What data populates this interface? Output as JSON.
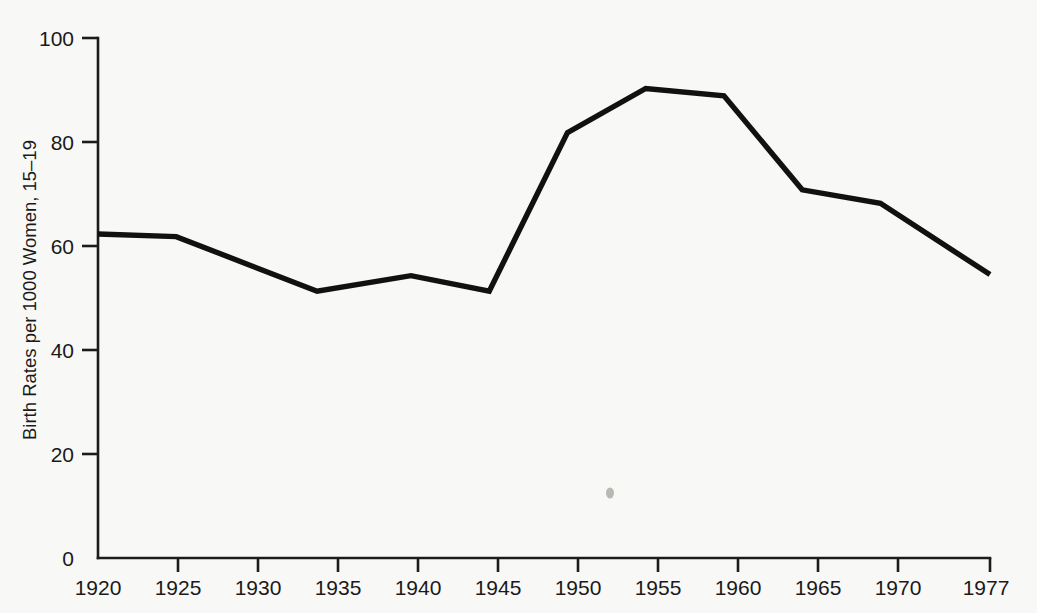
{
  "chart_data": {
    "type": "line",
    "title": "",
    "subtitle": "",
    "xlabel": "",
    "ylabel": "Birth Rates per 1000 Women, 15–19",
    "x": [
      1920,
      1925,
      1934,
      1940,
      1945,
      1950,
      1955,
      1960,
      1965,
      1970,
      1977
    ],
    "values": [
      62.3,
      61.8,
      51.3,
      54.3,
      51.3,
      81.8,
      90.3,
      88.9,
      70.8,
      68.2,
      54.5
    ],
    "series": [
      {
        "name": "Birth Rates per 1000 Women, 15-19",
        "x": [
          1920,
          1925,
          1934,
          1940,
          1945,
          1950,
          1955,
          1960,
          1965,
          1970,
          1977
        ],
        "values": [
          62.3,
          61.8,
          51.3,
          54.3,
          51.3,
          81.8,
          90.3,
          88.9,
          70.8,
          68.2,
          54.5
        ]
      }
    ],
    "xlim": [
      1920,
      1977
    ],
    "ylim": [
      0,
      100
    ],
    "xticks": [
      1920,
      1925,
      1930,
      1935,
      1940,
      1945,
      1950,
      1955,
      1960,
      1965,
      1970,
      1977
    ],
    "xtick_labels": [
      "1920",
      "1925",
      "1930",
      "1935",
      "1940",
      "1945",
      "1950",
      "1955",
      "1960",
      "1965",
      "1970",
      "1977"
    ],
    "yticks": [
      0,
      20,
      40,
      60,
      80,
      100
    ],
    "ytick_labels": [
      "0",
      "20",
      "40",
      "60",
      "80",
      "100"
    ],
    "grid": false,
    "legend": false,
    "legend_position": "none",
    "line_color": "#111111",
    "background_color": "#f8f8f6",
    "axis_color": "#1c1c1c",
    "annotations": []
  },
  "axes": {
    "y_title": "Birth Rates per 1000 Women, 15–19",
    "x_tick_0": "1920",
    "x_tick_1": "1925",
    "x_tick_2": "1930",
    "x_tick_3": "1935",
    "x_tick_4": "1940",
    "x_tick_5": "1945",
    "x_tick_6": "1950",
    "x_tick_7": "1955",
    "x_tick_8": "1960",
    "x_tick_9": "1965",
    "x_tick_10": "1970",
    "x_tick_11": "1977",
    "y_tick_0": "0",
    "y_tick_1": "20",
    "y_tick_2": "40",
    "y_tick_3": "60",
    "y_tick_4": "80",
    "y_tick_5": "100"
  }
}
